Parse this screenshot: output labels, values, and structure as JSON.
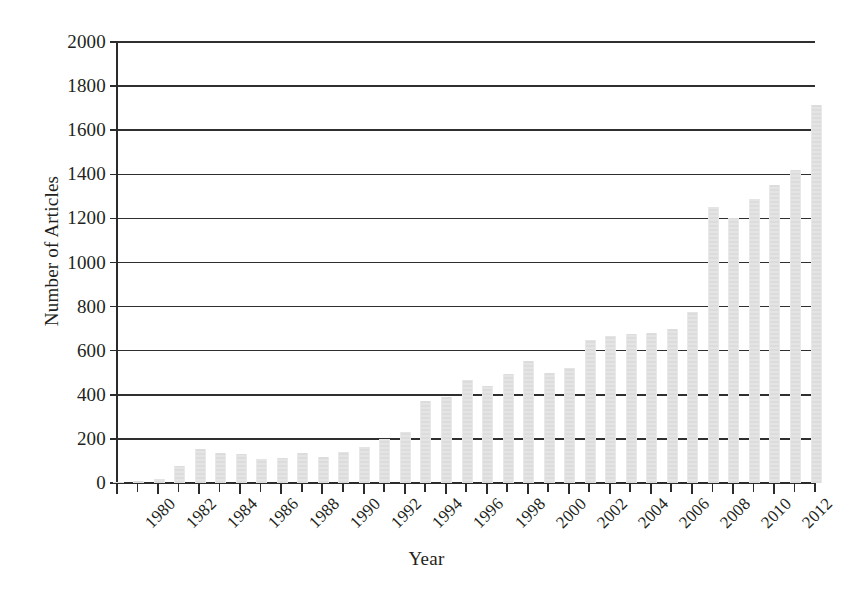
{
  "chart_data": {
    "type": "bar",
    "title": "",
    "xlabel": "Year",
    "ylabel": "Number of Articles",
    "ylim": [
      0,
      2000
    ],
    "ytick_step": 200,
    "yticks": [
      0,
      200,
      400,
      600,
      800,
      1000,
      1200,
      1400,
      1600,
      1800,
      2000
    ],
    "grid": "horizontal",
    "legend": "none",
    "bar_color": "#dcdcdc",
    "axis_color": "#2b2b2b",
    "xtick_labels": [
      "1980",
      "1982",
      "1984",
      "1986",
      "1988",
      "1990",
      "1992",
      "1994",
      "1996",
      "1998",
      "2000",
      "2002",
      "2004",
      "2006",
      "2008",
      "2010",
      "2012"
    ],
    "xtick_label_step": 2,
    "categories": [
      "1980",
      "1981",
      "1982",
      "1983",
      "1984",
      "1985",
      "1986",
      "1987",
      "1988",
      "1989",
      "1990",
      "1991",
      "1992",
      "1993",
      "1994",
      "1995",
      "1996",
      "1997",
      "1998",
      "1999",
      "2000",
      "2001",
      "2002",
      "2003",
      "2004",
      "2005",
      "2006",
      "2007",
      "2008",
      "2009",
      "2010",
      "2011",
      "2012",
      "2013",
      "2014"
    ],
    "values": [
      5,
      10,
      18,
      75,
      155,
      135,
      130,
      110,
      115,
      135,
      120,
      140,
      165,
      200,
      230,
      370,
      390,
      465,
      440,
      495,
      555,
      500,
      520,
      650,
      665,
      675,
      680,
      700,
      775,
      1250,
      1200,
      1290,
      1350,
      1420,
      1715
    ],
    "last_values_note": "",
    "notes": ""
  }
}
